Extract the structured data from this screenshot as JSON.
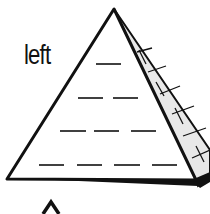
{
  "diagram": {
    "type": "pyramid",
    "side_label": "left",
    "rows": [
      {
        "blanks": 1
      },
      {
        "blanks": 2
      },
      {
        "blanks": 3
      },
      {
        "blanks": 4
      }
    ],
    "colors": {
      "line": "#111111",
      "side_face": "#e8e8e8",
      "background": "#ffffff"
    }
  }
}
